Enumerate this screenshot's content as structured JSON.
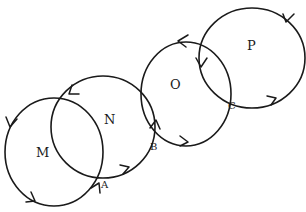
{
  "diagram": {
    "stroke_color": "#1a1a1a",
    "background": "#ffffff",
    "loops": [
      {
        "name": "M",
        "cx": 54,
        "cy": 152,
        "rx": 49,
        "ry": 54,
        "label_x": 36,
        "label_y": 152
      },
      {
        "name": "N",
        "cx": 104,
        "cy": 128,
        "rx": 51,
        "ry": 50,
        "label_x": 104,
        "label_y": 119
      },
      {
        "name": "O",
        "cx": 186,
        "cy": 95,
        "rx": 46,
        "ry": 51,
        "label_x": 170,
        "label_y": 84
      },
      {
        "name": "P",
        "cx": 251,
        "cy": 58,
        "rx": 53,
        "ry": 49,
        "label_x": 247,
        "label_y": 44
      }
    ],
    "points": [
      {
        "name": "A",
        "x": 101,
        "y": 184
      },
      {
        "name": "B",
        "x": 152,
        "y": 146
      },
      {
        "name": "C",
        "x": 228,
        "y": 104
      }
    ],
    "labels": {
      "M": "M",
      "N": "N",
      "O": "O",
      "P": "P",
      "A": "A",
      "B": "B",
      "C": "C"
    }
  }
}
